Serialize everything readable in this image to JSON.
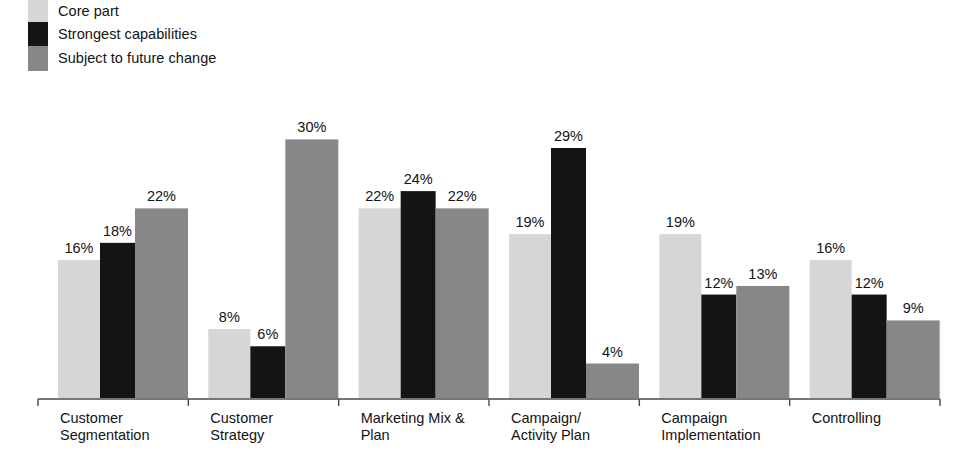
{
  "legend": {
    "items": [
      {
        "label": "Core part",
        "color": "#d6d6d6"
      },
      {
        "label": "Strongest capabilities",
        "color": "#141414"
      },
      {
        "label": "Subject to future change",
        "color": "#878787"
      }
    ]
  },
  "chart_data": {
    "type": "bar",
    "title": "",
    "xlabel": "",
    "ylabel": "",
    "ylim": [
      0,
      32
    ],
    "grid": false,
    "legend_position": "top-left",
    "value_suffix": "%",
    "categories": [
      "Customer Segmentation",
      "Customer Strategy",
      "Marketing Mix & Plan",
      "Campaign/ Activity Plan",
      "Campaign Implementation",
      "Controlling"
    ],
    "category_lines": [
      [
        "Customer",
        "Segmentation"
      ],
      [
        "Customer",
        "Strategy"
      ],
      [
        "Marketing Mix &",
        "Plan"
      ],
      [
        "Campaign/",
        "Activity Plan"
      ],
      [
        "Campaign",
        "Implementation"
      ],
      [
        "Controlling"
      ]
    ],
    "series": [
      {
        "name": "Core part",
        "color": "#d6d6d6",
        "values": [
          16,
          8,
          22,
          19,
          19,
          16
        ]
      },
      {
        "name": "Strongest capabilities",
        "color": "#141414",
        "values": [
          18,
          6,
          24,
          29,
          12,
          12
        ]
      },
      {
        "name": "Subject to future change",
        "color": "#878787",
        "values": [
          22,
          30,
          22,
          4,
          13,
          9
        ]
      }
    ],
    "value_labels": [
      [
        "16%",
        "18%",
        "22%"
      ],
      [
        "8%",
        "6%",
        "30%"
      ],
      [
        "22%",
        "24%",
        "22%"
      ],
      [
        "19%",
        "29%",
        "4%"
      ],
      [
        "19%",
        "12%",
        "13%"
      ],
      [
        "16%",
        "12%",
        "9%"
      ]
    ],
    "axis": {
      "color": "#4a4a4a",
      "baseline_y": 398,
      "x_start": 38,
      "x_end": 940
    }
  }
}
